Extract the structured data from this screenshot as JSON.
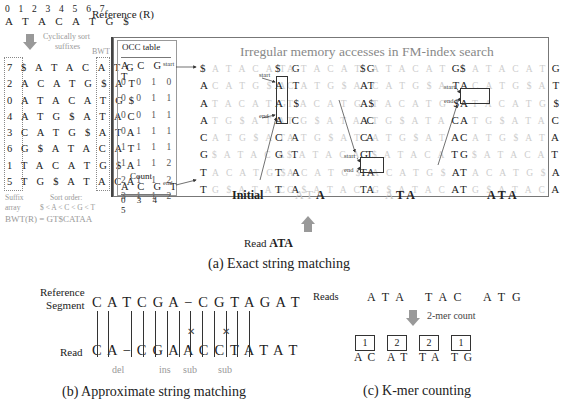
{
  "exact_matching": {
    "reference": {
      "indices": "0 1 2 3 4 5 6 7",
      "sequence": "A T A C A T G $",
      "label": "Reference (R)"
    },
    "sort_note_line1": "Cyclically sort",
    "sort_note_line2": "suffixes",
    "bwt_header": "BWT",
    "suffix_array": [
      {
        "idx": "7",
        "rot": "$ A T A C A T",
        "last": "G"
      },
      {
        "idx": "2",
        "rot": "A C A T G $ A",
        "last": "T"
      },
      {
        "idx": "0",
        "rot": "A T A C A T G",
        "last": "$"
      },
      {
        "idx": "4",
        "rot": "A T G $ A T A",
        "last": "C"
      },
      {
        "idx": "3",
        "rot": "C A T G $ A T",
        "last": "A"
      },
      {
        "idx": "6",
        "rot": "G $ A T A C A",
        "last": "T"
      },
      {
        "idx": "1",
        "rot": "T A C A T G $",
        "last": "A"
      },
      {
        "idx": "5",
        "rot": "T G $ A T A C",
        "last": "A"
      }
    ],
    "suffix_label_line1": "Suffix",
    "suffix_label_line2": "array",
    "sort_order_label": "Sort order:",
    "sort_order": "$ < A < C < G < T",
    "bwt_result": "BWT(R) = GT$CATAA",
    "occ_table": {
      "title": "OCC table",
      "header": "A C G T",
      "rows": [
        "0 0 1 0",
        "0 0 1 1",
        "0 0 1 1",
        "0 1 1 1",
        "1 1 1 1",
        "1 1 1 2",
        "2 1 1 2",
        "3 1 1 2"
      ]
    },
    "count": {
      "title": "Count",
      "header": "A C G T",
      "values": "0 3 4 5"
    },
    "title": "Irregular memory accesses in FM-index search",
    "bwm_first": [
      "$",
      "A",
      "A",
      "A",
      "C",
      "G",
      "T",
      "T"
    ],
    "bwm_middle": [
      "A T A C A T",
      "C A T G $ A",
      "T A C A T G",
      "T G $ A T A",
      "A T G $ A T",
      "$ A T A C A",
      "A C A T G $",
      "G $ A T A C"
    ],
    "bwm_last": [
      "G",
      "T",
      "$",
      "C",
      "A",
      "T",
      "A",
      "A"
    ],
    "pointer_start": "start",
    "pointer_end": "end",
    "steps": [
      {
        "label_faded": "",
        "label_bold": "Initial"
      },
      {
        "label_faded": "A T",
        "label_bold": "A"
      },
      {
        "label_faded": "A",
        "label_bold": "T A"
      },
      {
        "label_faded": "",
        "label_bold": "A T A"
      }
    ],
    "read_prefix": "Read",
    "read_value": "ATA",
    "caption": "(a) Exact string matching"
  },
  "approximate_matching": {
    "ref_label_line1": "Reference",
    "ref_label_line2": "Segment",
    "reference": "C A T C G A − C G T A G A T",
    "read_label": "Read",
    "read": "C A − C G A A C C T A T A T",
    "annotations": [
      {
        "label": "del"
      },
      {
        "label": "ins"
      },
      {
        "label": "sub"
      },
      {
        "label": "sub"
      }
    ],
    "caption": "(b) Approximate string matching"
  },
  "kmer_counting": {
    "reads_label": "Reads",
    "reads": [
      "A T A",
      "T A C",
      "A T G"
    ],
    "arrow_label": "2-mer count",
    "kmers": [
      {
        "count": "1",
        "kmer": "A C"
      },
      {
        "count": "2",
        "kmer": "A T"
      },
      {
        "count": "2",
        "kmer": "T A"
      },
      {
        "count": "1",
        "kmer": "T G"
      }
    ],
    "caption": "(c) K-mer counting"
  }
}
